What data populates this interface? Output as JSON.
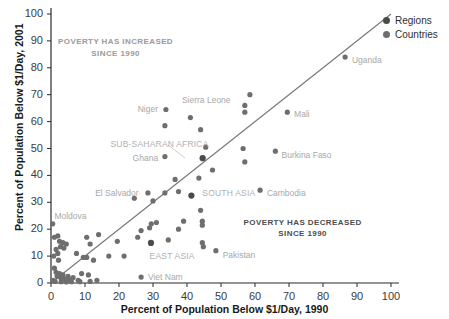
{
  "chart_data": {
    "type": "scatter",
    "title": "",
    "xlabel": "Percent of Population Below $1/Day, 1990",
    "ylabel": "Percent of Population Below $1/Day, 2001",
    "xlim": [
      0,
      100
    ],
    "ylim": [
      0,
      100
    ],
    "xticks": [
      0,
      10,
      20,
      30,
      40,
      50,
      60,
      70,
      80,
      90,
      100
    ],
    "yticks": [
      0,
      10,
      20,
      30,
      40,
      50,
      60,
      70,
      80,
      90,
      100
    ],
    "grid": false,
    "legend_position": "top-right",
    "reference_line": {
      "name": "45-degree parity line",
      "from": [
        0,
        0
      ],
      "to": [
        100,
        100
      ]
    },
    "legend": [
      {
        "label": "Regions",
        "color": "#4a4a4a"
      },
      {
        "label": "Countries",
        "color": "#6e6e6e"
      }
    ],
    "annotations": [
      {
        "text_line1": "POVERTY HAS INCREASED",
        "text_line2": "SINCE 1990",
        "x": 19,
        "y": 88,
        "style": "light"
      },
      {
        "text_line1": "POVERTY HAS DECREASED",
        "text_line2": "SINCE 1990",
        "x": 74,
        "y": 21,
        "style": "dark"
      }
    ],
    "series": [
      {
        "name": "Regions",
        "color": "#4a4a4a",
        "points": [
          {
            "label": "SUB-SAHARAN AFRICA",
            "x": 44.6,
            "y": 46.4,
            "label_x": 17.5,
            "label_y": 51.5
          },
          {
            "label": "SOUTH ASIA",
            "x": 41.3,
            "y": 32.5,
            "label_x": 44.5,
            "label_y": 33.5
          },
          {
            "label": "EAST ASIA",
            "x": 29.4,
            "y": 14.9,
            "label_x": 29.0,
            "label_y": 10.0
          }
        ]
      },
      {
        "name": "Countries",
        "color": "#6e6e6e",
        "points": [
          {
            "label": "Uganda",
            "x": 86.5,
            "y": 84.0,
            "label_x": 88.5,
            "label_y": 83.0
          },
          {
            "label": "Mali",
            "x": 69.5,
            "y": 63.5,
            "label_x": 71.5,
            "label_y": 63.0
          },
          {
            "label": "Burkina Faso",
            "x": 66.0,
            "y": 49.0,
            "label_x": 67.8,
            "label_y": 47.5
          },
          {
            "label": "Cambodia",
            "x": 61.5,
            "y": 34.5,
            "label_x": 63.5,
            "label_y": 33.5
          },
          {
            "label": "Niger",
            "x": 33.8,
            "y": 64.5,
            "label_x": 25.5,
            "label_y": 64.5
          },
          {
            "label": "Sierra Leone",
            "x": 57.0,
            "y": 66.0,
            "label_x": 38.5,
            "label_y": 68.0
          },
          {
            "label": "Ghana",
            "x": 33.5,
            "y": 47.0,
            "label_x": 24.0,
            "label_y": 46.5
          },
          {
            "label": "El Salvador",
            "x": 24.5,
            "y": 31.5,
            "label_x": 13.0,
            "label_y": 33.5
          },
          {
            "label": "Moldova",
            "x": 0.5,
            "y": 22.0,
            "label_x": 1.0,
            "label_y": 25.0
          },
          {
            "label": "Pakistan",
            "x": 48.5,
            "y": 12.0,
            "label_x": 50.5,
            "label_y": 10.5
          },
          {
            "label": "Viet Nam",
            "x": 26.5,
            "y": 2.2,
            "label_x": 28.5,
            "label_y": 2.2
          },
          {
            "label": "",
            "x": 33.5,
            "y": 58.5
          },
          {
            "label": "",
            "x": 41.0,
            "y": 61.5
          },
          {
            "label": "",
            "x": 58.5,
            "y": 70.0
          },
          {
            "label": "",
            "x": 57.0,
            "y": 63.5
          },
          {
            "label": "",
            "x": 44.0,
            "y": 57.0
          },
          {
            "label": "",
            "x": 45.5,
            "y": 50.5
          },
          {
            "label": "",
            "x": 56.5,
            "y": 50.0
          },
          {
            "label": "",
            "x": 57.0,
            "y": 45.0
          },
          {
            "label": "",
            "x": 47.5,
            "y": 42.0
          },
          {
            "label": "",
            "x": 43.5,
            "y": 39.0
          },
          {
            "label": "",
            "x": 36.5,
            "y": 38.5
          },
          {
            "label": "",
            "x": 37.5,
            "y": 34.0
          },
          {
            "label": "",
            "x": 33.5,
            "y": 33.5
          },
          {
            "label": "",
            "x": 28.5,
            "y": 33.5
          },
          {
            "label": "",
            "x": 30.0,
            "y": 30.5
          },
          {
            "label": "",
            "x": 44.0,
            "y": 27.0
          },
          {
            "label": "",
            "x": 44.5,
            "y": 23.0
          },
          {
            "label": "",
            "x": 39.0,
            "y": 23.0
          },
          {
            "label": "",
            "x": 44.5,
            "y": 21.5
          },
          {
            "label": "",
            "x": 31.0,
            "y": 22.5
          },
          {
            "label": "",
            "x": 29.5,
            "y": 22.0
          },
          {
            "label": "",
            "x": 29.0,
            "y": 20.5
          },
          {
            "label": "",
            "x": 37.5,
            "y": 20.0
          },
          {
            "label": "",
            "x": 26.5,
            "y": 19.5
          },
          {
            "label": "",
            "x": 25.5,
            "y": 17.0
          },
          {
            "label": "",
            "x": 34.5,
            "y": 16.0
          },
          {
            "label": "",
            "x": 44.5,
            "y": 15.0
          },
          {
            "label": "",
            "x": 44.8,
            "y": 13.5
          },
          {
            "label": "",
            "x": 19.5,
            "y": 15.5
          },
          {
            "label": "",
            "x": 14.0,
            "y": 18.0
          },
          {
            "label": "",
            "x": 10.5,
            "y": 17.0
          },
          {
            "label": "",
            "x": 11.5,
            "y": 14.5
          },
          {
            "label": "",
            "x": 21.5,
            "y": 10.0
          },
          {
            "label": "",
            "x": 17.0,
            "y": 10.0
          },
          {
            "label": "",
            "x": 12.5,
            "y": 8.5
          },
          {
            "label": "",
            "x": 10.5,
            "y": 9.5
          },
          {
            "label": "",
            "x": 9.5,
            "y": 9.5
          },
          {
            "label": "",
            "x": 7.5,
            "y": 11.0
          },
          {
            "label": "",
            "x": 4.5,
            "y": 14.5
          },
          {
            "label": "",
            "x": 3.5,
            "y": 15.0
          },
          {
            "label": "",
            "x": 2.5,
            "y": 15.5
          },
          {
            "label": "",
            "x": 2.0,
            "y": 17.5
          },
          {
            "label": "",
            "x": 1.0,
            "y": 17.0
          },
          {
            "label": "",
            "x": 2.8,
            "y": 13.5
          },
          {
            "label": "",
            "x": 3.8,
            "y": 13.0
          },
          {
            "label": "",
            "x": 1.5,
            "y": 12.5
          },
          {
            "label": "",
            "x": 2.0,
            "y": 11.0
          },
          {
            "label": "",
            "x": 0.8,
            "y": 10.0
          },
          {
            "label": "",
            "x": 2.2,
            "y": 8.5
          },
          {
            "label": "",
            "x": 1.0,
            "y": 5.5
          },
          {
            "label": "",
            "x": 1.5,
            "y": 4.0
          },
          {
            "label": "",
            "x": 2.5,
            "y": 3.5
          },
          {
            "label": "",
            "x": 3.5,
            "y": 3.0
          },
          {
            "label": "",
            "x": 1.8,
            "y": 2.5
          },
          {
            "label": "",
            "x": 2.8,
            "y": 2.0
          },
          {
            "label": "",
            "x": 4.0,
            "y": 1.5
          },
          {
            "label": "",
            "x": 5.0,
            "y": 2.5
          },
          {
            "label": "",
            "x": 5.5,
            "y": 1.2
          },
          {
            "label": "",
            "x": 6.5,
            "y": 2.0
          },
          {
            "label": "",
            "x": 0.6,
            "y": 1.0
          },
          {
            "label": "",
            "x": 1.2,
            "y": 0.6
          },
          {
            "label": "",
            "x": 3.0,
            "y": 0.5
          },
          {
            "label": "",
            "x": 4.5,
            "y": 0.4
          },
          {
            "label": "",
            "x": 6.0,
            "y": 0.5
          },
          {
            "label": "",
            "x": 8.0,
            "y": 1.0
          },
          {
            "label": "",
            "x": 9.0,
            "y": 3.5
          },
          {
            "label": "",
            "x": 11.0,
            "y": 3.0
          },
          {
            "label": "",
            "x": 8.5,
            "y": 0.5
          },
          {
            "label": "",
            "x": 11.5,
            "y": 0.6
          },
          {
            "label": "",
            "x": 13.5,
            "y": 1.0
          }
        ]
      }
    ]
  }
}
